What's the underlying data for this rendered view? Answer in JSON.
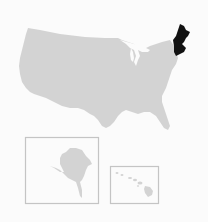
{
  "map": {
    "type": "locator-map",
    "region": "United States",
    "highlighted_region": "New England",
    "colors": {
      "background": "#fbfbfb",
      "land": "#d3d3d3",
      "highlight": "#111111",
      "inset_border": "#c4c4c4"
    },
    "insets": [
      {
        "name": "Alaska"
      },
      {
        "name": "Hawaii"
      }
    ]
  }
}
